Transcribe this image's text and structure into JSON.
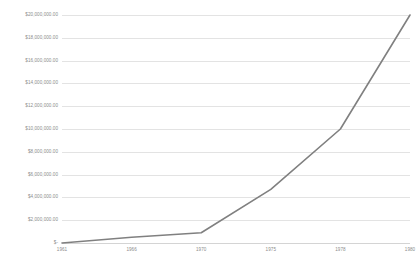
{
  "chart_data": {
    "type": "line",
    "title": "",
    "subtitle": "",
    "xlabel": "",
    "ylabel": "",
    "categories": [
      "1961",
      "1966",
      "1970",
      "1975",
      "1978",
      "1980"
    ],
    "x": [
      1961,
      1966,
      1970,
      1975,
      1978,
      1980
    ],
    "series": [
      {
        "name": "",
        "values": [
          0,
          500000,
          900000,
          4700000,
          10000000,
          20000000
        ]
      }
    ],
    "ylim": [
      0,
      20000000
    ],
    "y_tick_values": [
      0,
      2000000,
      4000000,
      6000000,
      8000000,
      10000000,
      12000000,
      14000000,
      16000000,
      18000000,
      20000000
    ],
    "y_tick_labels": [
      "$-",
      "$2,000,000.00",
      "$4,000,000.00",
      "$6,000,000.00",
      "$8,000,000.00",
      "$10,000,000.00",
      "$12,000,000.00",
      "$14,000,000.00",
      "$16,000,000.00",
      "$18,000,000.00",
      "$20,000,000.00"
    ],
    "x_tick_labels": [
      "1961",
      "1966",
      "1970",
      "1975",
      "1978",
      "1980"
    ],
    "grid": true,
    "grid_axis": "y",
    "legend": false,
    "legend_position": "none",
    "annotations": [],
    "colors": {
      "line": "#808080",
      "grid": "#e3e3e3",
      "axis": "#d4d4d4",
      "tick_label": "#8c8c8c",
      "background": "#ffffff"
    }
  }
}
